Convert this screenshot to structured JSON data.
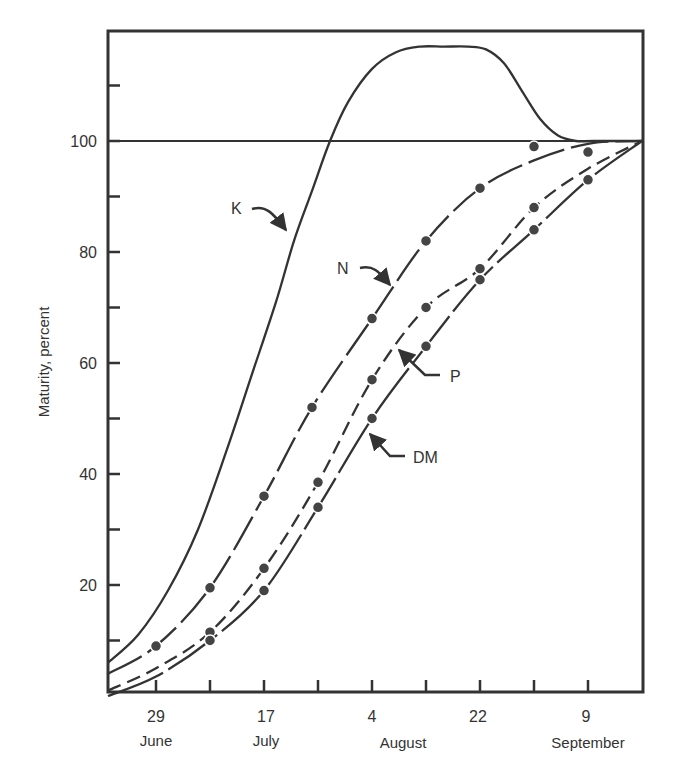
{
  "chart_data": {
    "type": "line",
    "title": "",
    "xlabel": "",
    "ylabel": "Maturity, percent",
    "x_axis": {
      "unit": "days after 21 June",
      "range": [
        0,
        89
      ],
      "ticks": [
        8,
        17,
        26,
        35,
        44,
        53,
        62,
        71,
        80
      ],
      "labels": [
        {
          "day": 8,
          "value": "29",
          "month": "June"
        },
        {
          "day": 26,
          "value": "17",
          "month": "July"
        },
        {
          "day": 44,
          "value": "4",
          "month": "August"
        },
        {
          "day": 62,
          "value": "22",
          "month": ""
        },
        {
          "day": 80,
          "value": "9",
          "month": "September"
        }
      ],
      "august_label_day": 52
    },
    "y_axis": {
      "range": [
        0,
        118
      ],
      "ticks": [
        10,
        20,
        30,
        40,
        50,
        60,
        70,
        80,
        90,
        100,
        110
      ],
      "labels": [
        20,
        40,
        60,
        80,
        100
      ]
    },
    "reference_line": {
      "y": 100
    },
    "grid": false,
    "series": [
      {
        "name": "K",
        "style": "solid",
        "markers": false,
        "x": [
          0,
          5,
          10,
          15,
          20,
          24,
          28,
          31,
          34,
          37,
          40,
          44,
          48,
          52,
          56,
          60,
          63,
          66,
          69,
          72,
          75,
          78,
          81,
          89
        ],
        "y": [
          6,
          11,
          19,
          30,
          45,
          58,
          71,
          82,
          91,
          100,
          107,
          113,
          116,
          117,
          117,
          117,
          116.5,
          114,
          109,
          104,
          101,
          100,
          100,
          100
        ]
      },
      {
        "name": "N",
        "style": "long-dash-dot",
        "markers": true,
        "x": [
          0,
          8,
          17,
          26,
          34,
          44,
          53,
          62,
          71,
          80,
          89
        ],
        "y": [
          4,
          9,
          19.5,
          36,
          52,
          68,
          82,
          91.5,
          96.5,
          99.5,
          100
        ],
        "points": [
          [
            8,
            9
          ],
          [
            17,
            19.5
          ],
          [
            26,
            36
          ],
          [
            34,
            52
          ],
          [
            44,
            68
          ],
          [
            53,
            82
          ],
          [
            62,
            91.5
          ],
          [
            71,
            99
          ],
          [
            80,
            98
          ]
        ]
      },
      {
        "name": "P",
        "style": "dashed",
        "markers": true,
        "x": [
          0,
          8,
          17,
          26,
          35,
          44,
          53,
          62,
          71,
          80,
          89
        ],
        "y": [
          1,
          5,
          11.5,
          23,
          38.5,
          57,
          70,
          77,
          88,
          95,
          100
        ],
        "points": [
          [
            17,
            11.5
          ],
          [
            26,
            23
          ],
          [
            35,
            38.5
          ],
          [
            44,
            57
          ],
          [
            53,
            70
          ],
          [
            62,
            77
          ],
          [
            71,
            88
          ]
        ]
      },
      {
        "name": "DM",
        "style": "solid-broken",
        "markers": true,
        "x": [
          0,
          8,
          17,
          26,
          35,
          44,
          53,
          62,
          71,
          80,
          89
        ],
        "y": [
          0,
          3.5,
          10,
          19,
          34,
          50,
          63,
          75,
          84,
          93,
          100
        ],
        "points": [
          [
            17,
            10
          ],
          [
            26,
            19
          ],
          [
            35,
            34
          ],
          [
            44,
            50
          ],
          [
            53,
            63
          ],
          [
            62,
            75
          ],
          [
            71,
            84
          ],
          [
            80,
            93
          ]
        ]
      }
    ],
    "annotations": [
      {
        "text": "K",
        "label_x": 238,
        "label_y": 214,
        "arrow_to": [
          287,
          232
        ]
      },
      {
        "text": "N",
        "label_x": 343,
        "label_y": 274,
        "arrow_to": [
          391,
          287
        ]
      },
      {
        "text": "P",
        "label_x": 450,
        "label_y": 381,
        "arrow_to": [
          397,
          348
        ]
      },
      {
        "text": "DM",
        "label_x": 414,
        "label_y": 462,
        "arrow_to": [
          369,
          432
        ]
      }
    ]
  },
  "axis_text": {
    "ylabel": "Maturity, percent",
    "y20": "20",
    "y40": "40",
    "y60": "60",
    "y80": "80",
    "y100": "100",
    "x29": "29",
    "x17": "17",
    "x4": "4",
    "x22": "22",
    "x9": "9",
    "june": "June",
    "july": "July",
    "august": "August",
    "september": "September",
    "k": "K",
    "n": "N",
    "p": "P",
    "dm": "DM"
  }
}
